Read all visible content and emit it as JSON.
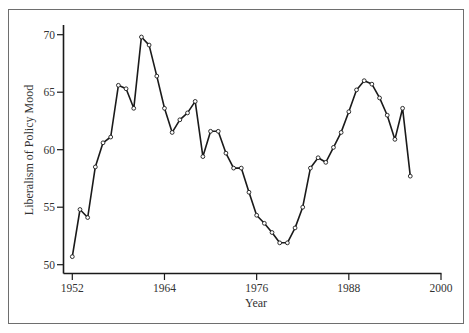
{
  "chart_data": {
    "type": "line",
    "title": "",
    "xlabel": "Year",
    "ylabel": "Liberalism of Policy Mood",
    "xlim": [
      1952,
      2000
    ],
    "ylim": [
      50,
      70
    ],
    "x_ticks": [
      1952,
      1964,
      1976,
      1988,
      2000
    ],
    "y_ticks": [
      50,
      55,
      60,
      65,
      70
    ],
    "grid": false,
    "legend": null,
    "markers": "hollow-circle",
    "line_color": "#1a1a1a",
    "series": [
      {
        "name": "Policy Mood",
        "x": [
          1952,
          1953,
          1954,
          1955,
          1956,
          1957,
          1958,
          1959,
          1960,
          1961,
          1962,
          1963,
          1964,
          1965,
          1966,
          1967,
          1968,
          1969,
          1970,
          1971,
          1972,
          1973,
          1974,
          1975,
          1976,
          1977,
          1978,
          1979,
          1980,
          1981,
          1982,
          1983,
          1984,
          1985,
          1986,
          1987,
          1988,
          1989,
          1990,
          1991,
          1992,
          1993,
          1994,
          1995,
          1996
        ],
        "values": [
          50.7,
          54.8,
          54.1,
          58.5,
          60.6,
          61.1,
          65.6,
          65.3,
          63.6,
          69.8,
          69.1,
          66.4,
          63.6,
          61.5,
          62.6,
          63.2,
          64.2,
          59.4,
          61.6,
          61.6,
          59.7,
          58.4,
          58.4,
          56.3,
          54.3,
          53.6,
          52.8,
          51.9,
          51.9,
          53.2,
          55.0,
          58.4,
          59.3,
          58.9,
          60.2,
          61.5,
          63.3,
          65.2,
          66.0,
          65.7,
          64.5,
          63.0,
          60.9,
          63.6,
          57.7
        ]
      }
    ]
  },
  "labels": {
    "x_ticks": [
      "1952",
      "1964",
      "1976",
      "1988",
      "2000"
    ],
    "y_ticks": [
      "50",
      "55",
      "60",
      "65",
      "70"
    ],
    "xlabel": "Year",
    "ylabel": "Liberalism of Policy Mood"
  }
}
